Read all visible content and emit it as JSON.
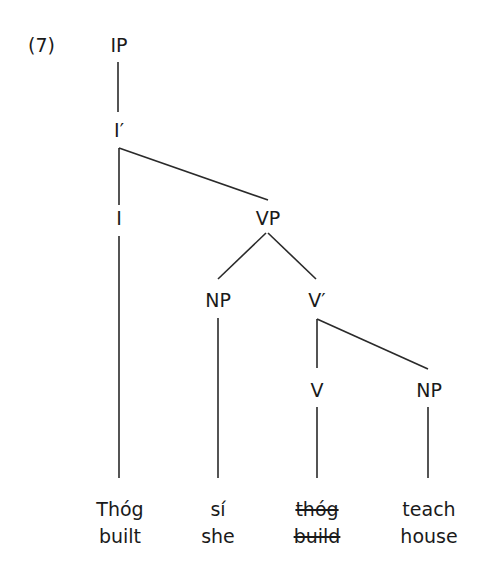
{
  "example_number": "(7)",
  "nodes": {
    "ip": "IP",
    "i_bar": "I′",
    "i": "I",
    "vp": "VP",
    "np_subject": "NP",
    "v_bar": "V′",
    "v": "V",
    "np_object": "NP"
  },
  "leaves": [
    {
      "word": "Thóg",
      "gloss": "built",
      "struck": false
    },
    {
      "word": "sí",
      "gloss": "she",
      "struck": false
    },
    {
      "word": "thóg",
      "gloss": "build",
      "struck": true
    },
    {
      "word": "teach",
      "gloss": "house",
      "struck": false
    }
  ],
  "colors": {
    "line": "#2a2a2a",
    "text": "#1a1a1a",
    "background": "#ffffff"
  }
}
